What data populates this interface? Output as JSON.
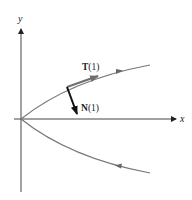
{
  "figure": {
    "axes": {
      "x_label": "x",
      "y_label": "y"
    },
    "curve": {
      "type": "parabola",
      "opens": "right",
      "direction_arrows": [
        "upper-branch-rightward",
        "lower-branch-leftward"
      ]
    },
    "vectors": {
      "tangent": {
        "bold": "T",
        "arg": "(1)"
      },
      "normal": {
        "bold": "N",
        "arg": "(1)"
      }
    },
    "colors": {
      "axis": "#333333",
      "curve": "#777777",
      "tangent": "#777777",
      "normal": "#111111"
    }
  }
}
